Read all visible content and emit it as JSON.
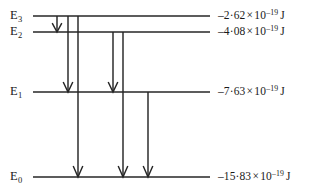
{
  "figure": {
    "type": "energy-level-diagram",
    "title": "",
    "background_color": "#ffffff",
    "line_color": "#262626"
  },
  "levels": [
    {
      "id": "E3",
      "label_base": "E",
      "label_sub": "3",
      "energy_mantissa": "–2·62",
      "energy_times": "×",
      "energy_base": "10",
      "energy_exponent": "–19",
      "energy_unit": "J",
      "value_joules": -2.62e-19,
      "y": 16
    },
    {
      "id": "E2",
      "label_base": "E",
      "label_sub": "2",
      "energy_mantissa": "–4·08",
      "energy_times": "×",
      "energy_base": "10",
      "energy_exponent": "–19",
      "energy_unit": "J",
      "value_joules": -4.08e-19,
      "y": 32
    },
    {
      "id": "E1",
      "label_base": "E",
      "label_sub": "1",
      "energy_mantissa": "–7·63",
      "energy_times": "×",
      "energy_base": "10",
      "energy_exponent": "–19",
      "energy_unit": "J",
      "value_joules": -7.63e-19,
      "y": 92
    },
    {
      "id": "E0",
      "label_base": "E",
      "label_sub": "0",
      "energy_mantissa": "–15·83",
      "energy_times": "×",
      "energy_base": "10",
      "energy_exponent": "–19",
      "energy_unit": "J",
      "value_joules": -1.583e-18,
      "y": 177
    }
  ],
  "transitions": [
    {
      "id": "t-e3-e2",
      "from": "E3",
      "to": "E2",
      "x": 57,
      "y_start": 16,
      "y_end": 32
    },
    {
      "id": "t-e3-e1",
      "from": "E3",
      "to": "E1",
      "x": 68,
      "y_start": 16,
      "y_end": 92
    },
    {
      "id": "t-e3-e0",
      "from": "E3",
      "to": "E0",
      "x": 78,
      "y_start": 16,
      "y_end": 177
    },
    {
      "id": "t-e2-e1",
      "from": "E2",
      "to": "E1",
      "x": 113,
      "y_start": 32,
      "y_end": 92
    },
    {
      "id": "t-e2-e0",
      "from": "E2",
      "to": "E0",
      "x": 123,
      "y_start": 32,
      "y_end": 177
    },
    {
      "id": "t-e1-e0",
      "from": "E1",
      "to": "E0",
      "x": 148,
      "y_start": 92,
      "y_end": 177
    }
  ],
  "geometry": {
    "line_x_start": 33,
    "line_x_end": 210,
    "label_x": 10,
    "value_x": 218
  }
}
